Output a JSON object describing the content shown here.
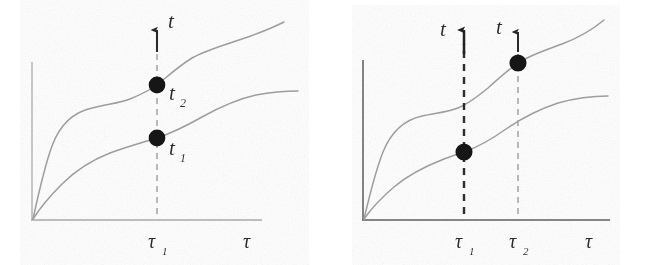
{
  "figure": {
    "type": "line-diagram",
    "background_color": "#ffffff",
    "ink_color": "#2b2b2b",
    "curve_color": "#9a9a9a",
    "axis_color_left": "#b0b0b0",
    "axis_color_right": "#6e6e6e",
    "dashed_bold_color": "#2f2f2f",
    "dashed_light_color": "#9a9a9a",
    "dot_color": "#171717"
  },
  "panels": [
    {
      "id": "left",
      "name": "single-slice-panel",
      "axis": {
        "y_label": "t",
        "x_label": "τ",
        "x_ticks": [
          {
            "label": "τ",
            "sub": "1"
          }
        ]
      },
      "vertical_lines": [
        {
          "name": "tau1-dashed-line",
          "tick": "τ₁",
          "style": "light-dashed",
          "has_arrow": true,
          "arrow_label": "t"
        }
      ],
      "points": [
        {
          "name": "point-t2",
          "label": "t",
          "sub": "2",
          "on_curve": "upper",
          "at_tick": "τ₁"
        },
        {
          "name": "point-t1",
          "label": "t",
          "sub": "1",
          "on_curve": "lower",
          "at_tick": "τ₁"
        }
      ],
      "curves": [
        {
          "name": "upper-curve",
          "shape": "monotone-increasing-with-plateau"
        },
        {
          "name": "lower-curve",
          "shape": "monotone-increasing-saturating"
        }
      ]
    },
    {
      "id": "right",
      "name": "two-slice-panel",
      "axis": {
        "y_label": "t",
        "x_label": "τ",
        "x_ticks": [
          {
            "label": "τ",
            "sub": "1"
          },
          {
            "label": "τ",
            "sub": "2"
          }
        ]
      },
      "vertical_lines": [
        {
          "name": "tau1-dashed-line",
          "tick": "τ₁",
          "style": "bold-dashed",
          "has_arrow": true,
          "arrow_label": "t"
        },
        {
          "name": "tau2-dashed-line",
          "tick": "τ₂",
          "style": "light-dashed",
          "has_arrow": true,
          "arrow_label": "t"
        }
      ],
      "points": [
        {
          "name": "point-lower-tau1",
          "label": "",
          "sub": "",
          "on_curve": "lower",
          "at_tick": "τ₁"
        },
        {
          "name": "point-upper-tau2",
          "label": "",
          "sub": "",
          "on_curve": "upper",
          "at_tick": "τ₂"
        }
      ],
      "curves": [
        {
          "name": "upper-curve",
          "shape": "monotone-increasing-with-plateau"
        },
        {
          "name": "lower-curve",
          "shape": "monotone-increasing-saturating"
        }
      ]
    }
  ],
  "labels": {
    "t": "t",
    "tau": "τ",
    "one": "1",
    "two": "2"
  }
}
